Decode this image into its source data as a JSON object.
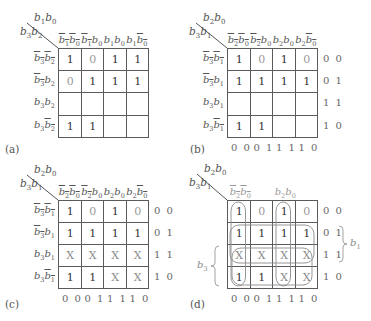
{
  "figure": {
    "panels": [
      {
        "id": "a",
        "tag": "(a)",
        "corner_top": {
          "v1": "b",
          "s1": "1",
          "v2": "b",
          "s2": "0"
        },
        "corner_left": {
          "v1": "b",
          "s1": "3",
          "v2": "b",
          "s2": "2"
        },
        "col_headers": [
          {
            "a": "b",
            "as": "1",
            "ab": true,
            "b": "b",
            "bs": "0",
            "bb": true
          },
          {
            "a": "b",
            "as": "1",
            "ab": true,
            "b": "b",
            "bs": "0",
            "bb": false
          },
          {
            "a": "b",
            "as": "1",
            "ab": false,
            "b": "b",
            "bs": "0",
            "bb": false
          },
          {
            "a": "b",
            "as": "1",
            "ab": false,
            "b": "b",
            "bs": "0",
            "bb": true
          }
        ],
        "row_headers": [
          {
            "a": "b",
            "as": "3",
            "ab": true,
            "b": "b",
            "bs": "2",
            "bb": true
          },
          {
            "a": "b",
            "as": "3",
            "ab": true,
            "b": "b",
            "bs": "2",
            "bb": false
          },
          {
            "a": "b",
            "as": "3",
            "ab": false,
            "b": "b",
            "bs": "2",
            "bb": false
          },
          {
            "a": "b",
            "as": "3",
            "ab": false,
            "b": "b",
            "bs": "2",
            "bb": true
          }
        ],
        "cells": [
          [
            "1",
            "0",
            "1",
            "1"
          ],
          [
            "0",
            "1",
            "1",
            "1"
          ],
          [
            "",
            "",
            "",
            ""
          ],
          [
            "1",
            "1",
            "",
            ""
          ]
        ],
        "row_codes": [],
        "col_codes": []
      },
      {
        "id": "b",
        "tag": "(b)",
        "corner_top": {
          "v1": "b",
          "s1": "2",
          "v2": "b",
          "s2": "0"
        },
        "corner_left": {
          "v1": "b",
          "s1": "3",
          "v2": "b",
          "s2": "1"
        },
        "col_headers": [
          {
            "a": "b",
            "as": "2",
            "ab": true,
            "b": "b",
            "bs": "0",
            "bb": true
          },
          {
            "a": "b",
            "as": "2",
            "ab": true,
            "b": "b",
            "bs": "0",
            "bb": false
          },
          {
            "a": "b",
            "as": "2",
            "ab": false,
            "b": "b",
            "bs": "0",
            "bb": false
          },
          {
            "a": "b",
            "as": "2",
            "ab": false,
            "b": "b",
            "bs": "0",
            "bb": true
          }
        ],
        "row_headers": [
          {
            "a": "b",
            "as": "3",
            "ab": true,
            "b": "b",
            "bs": "1",
            "bb": true
          },
          {
            "a": "b",
            "as": "3",
            "ab": true,
            "b": "b",
            "bs": "1",
            "bb": false
          },
          {
            "a": "b",
            "as": "3",
            "ab": false,
            "b": "b",
            "bs": "1",
            "bb": false
          },
          {
            "a": "b",
            "as": "3",
            "ab": false,
            "b": "b",
            "bs": "1",
            "bb": true
          }
        ],
        "cells": [
          [
            "1",
            "0",
            "1",
            "0"
          ],
          [
            "1",
            "1",
            "1",
            "1"
          ],
          [
            "",
            "",
            "",
            ""
          ],
          [
            "1",
            "1",
            "",
            ""
          ]
        ],
        "row_codes": [
          "0 0",
          "0 1",
          "1 1",
          "1 0"
        ],
        "col_codes": [
          "0 0",
          "0 1",
          "1 1",
          "1 0"
        ]
      },
      {
        "id": "c",
        "tag": "(c)",
        "corner_top": {
          "v1": "b",
          "s1": "2",
          "v2": "b",
          "s2": "0"
        },
        "corner_left": {
          "v1": "b",
          "s1": "3",
          "v2": "b",
          "s2": "1"
        },
        "col_headers": [
          {
            "a": "b",
            "as": "2",
            "ab": true,
            "b": "b",
            "bs": "0",
            "bb": true
          },
          {
            "a": "b",
            "as": "2",
            "ab": true,
            "b": "b",
            "bs": "0",
            "bb": false
          },
          {
            "a": "b",
            "as": "2",
            "ab": false,
            "b": "b",
            "bs": "0",
            "bb": false
          },
          {
            "a": "b",
            "as": "2",
            "ab": false,
            "b": "b",
            "bs": "0",
            "bb": true
          }
        ],
        "row_headers": [
          {
            "a": "b",
            "as": "3",
            "ab": true,
            "b": "b",
            "bs": "1",
            "bb": true
          },
          {
            "a": "b",
            "as": "3",
            "ab": true,
            "b": "b",
            "bs": "1",
            "bb": false
          },
          {
            "a": "b",
            "as": "3",
            "ab": false,
            "b": "b",
            "bs": "1",
            "bb": false
          },
          {
            "a": "b",
            "as": "3",
            "ab": false,
            "b": "b",
            "bs": "1",
            "bb": true
          }
        ],
        "cells": [
          [
            "1",
            "0",
            "1",
            "0"
          ],
          [
            "1",
            "1",
            "1",
            "1"
          ],
          [
            "X",
            "X",
            "X",
            "X"
          ],
          [
            "1",
            "1",
            "X",
            "X"
          ]
        ],
        "row_codes": [
          "0 0",
          "0 1",
          "1 1",
          "1 0"
        ],
        "col_codes": [
          "0 0",
          "0 1",
          "1 1",
          "1 0"
        ]
      },
      {
        "id": "d",
        "tag": "(d)",
        "corner_top": {
          "v1": "b",
          "s1": "2",
          "v2": "b",
          "s2": "0"
        },
        "corner_left": {
          "v1": "b",
          "s1": "3",
          "v2": "b",
          "s2": "1"
        },
        "col_headers": [
          {
            "a": "b",
            "as": "2",
            "ab": true,
            "b": "b",
            "bs": "0",
            "bb": true
          },
          null,
          {
            "a": "b",
            "as": "2",
            "ab": false,
            "b": "b",
            "bs": "0",
            "bb": false
          },
          null
        ],
        "row_headers": [],
        "cells": [
          [
            "1",
            "0",
            "1",
            "0"
          ],
          [
            "1",
            "1",
            "1",
            "1"
          ],
          [
            "X",
            "X",
            "X",
            "X"
          ],
          [
            "1",
            "1",
            "X",
            "X"
          ]
        ],
        "row_codes": [
          "0 0",
          "0 1",
          "1 1",
          "1 0"
        ],
        "col_codes": [
          "0 0",
          "0 1",
          "1 1",
          "1 0"
        ],
        "group_labels": {
          "right": {
            "v": "b",
            "s": "1"
          },
          "left": {
            "v": "b",
            "s": "3"
          }
        },
        "loops": [
          {
            "name": "b2bar-b0bar",
            "desc": "column 00 vertical loop"
          },
          {
            "name": "b2-b0",
            "desc": "column 11 vertical loop"
          },
          {
            "name": "b1",
            "desc": "rows 01 and 11 horizontal loop"
          },
          {
            "name": "b3",
            "desc": "rows 11 and 10 horizontal loop"
          }
        ]
      }
    ]
  }
}
